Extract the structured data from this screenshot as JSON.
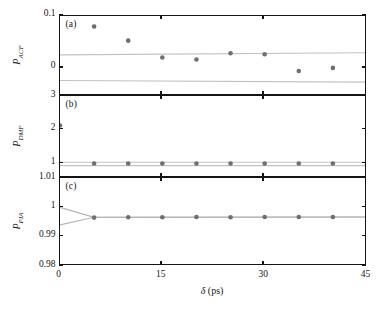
{
  "figure": {
    "x_axis": {
      "label_symbol": "δ",
      "label_unit": "(ps)",
      "ticks": [
        "0",
        "15",
        "30",
        "45"
      ],
      "min": 0,
      "max": 45
    },
    "panels": [
      {
        "tag": "(a)",
        "ylabel_base": "P",
        "ylabel_sub": "ACF",
        "yticks": [
          "0.1",
          "0"
        ],
        "ytick_values": [
          0.1,
          0
        ],
        "ymin": -0.0535,
        "ymax": 0.1
      },
      {
        "tag": "(b)",
        "ylabel_base": "P",
        "ylabel_sub": "DMF",
        "yticks": [
          "3",
          "2",
          "1"
        ],
        "ytick_values": [
          3,
          2,
          1
        ],
        "ymin": 0.56,
        "ymax": 3
      },
      {
        "tag": "(c)",
        "ylabel_base": "P",
        "ylabel_sub": "PIA",
        "yticks": [
          "1.01",
          "1",
          "0.99",
          "0.98"
        ],
        "ytick_values": [
          1.01,
          1,
          0.99,
          0.98
        ],
        "ymin": 0.98,
        "ymax": 1.01
      }
    ]
  },
  "chart_data": [
    {
      "type": "scatter",
      "panel": "(a)",
      "title": "",
      "xlabel": "δ (ps)",
      "ylabel": "P_ACF",
      "xlim": [
        0,
        45
      ],
      "ylim": [
        -0.0535,
        0.1
      ],
      "grid": false,
      "legend": "none",
      "xticks": [
        0,
        15,
        30,
        45
      ],
      "yticks": [
        0,
        0.1
      ],
      "series": [
        {
          "name": "P_ACF data",
          "marker": "filled-circle",
          "color": "#6f6f6f",
          "x": [
            5,
            10,
            15,
            20,
            25,
            30,
            35,
            40
          ],
          "y": [
            0.08,
            0.053,
            0.021,
            0.017,
            0.029,
            0.027,
            -0.005,
            0.001
          ]
        },
        {
          "name": "upper guide band",
          "type": "line",
          "color": "#c2c2c2",
          "x": [
            0,
            45
          ],
          "y": [
            0.026,
            0.03
          ]
        },
        {
          "name": "lower guide band",
          "type": "line",
          "color": "#c2c2c2",
          "x": [
            0,
            45
          ],
          "y": [
            -0.023,
            -0.026
          ]
        }
      ]
    },
    {
      "type": "scatter",
      "panel": "(b)",
      "title": "",
      "xlabel": "δ (ps)",
      "ylabel": "P_DMF",
      "xlim": [
        0,
        45
      ],
      "ylim": [
        0.56,
        3
      ],
      "grid": false,
      "legend": "none",
      "xticks": [
        0,
        15,
        30,
        45
      ],
      "yticks": [
        1,
        2,
        3
      ],
      "series": [
        {
          "name": "P_DMF data",
          "marker": "filled-circle",
          "color": "#6f6f6f",
          "x": [
            0,
            5,
            10,
            15,
            20,
            25,
            30,
            35,
            40,
            45
          ],
          "y": [
            2.12,
            0.99,
            0.99,
            0.99,
            0.99,
            0.99,
            0.99,
            0.99,
            0.99,
            0.99
          ]
        },
        {
          "name": "upper guide band",
          "type": "line",
          "color": "#c2c2c2",
          "x": [
            0,
            45
          ],
          "y": [
            1.03,
            1.03
          ]
        },
        {
          "name": "lower guide band",
          "type": "line",
          "color": "#c2c2c2",
          "x": [
            0,
            45
          ],
          "y": [
            0.93,
            0.93
          ]
        }
      ]
    },
    {
      "type": "scatter",
      "panel": "(c)",
      "title": "",
      "xlabel": "δ (ps)",
      "ylabel": "P_PIA",
      "xlim": [
        0,
        45
      ],
      "ylim": [
        0.98,
        1.01
      ],
      "grid": false,
      "legend": "none",
      "xticks": [
        0,
        15,
        30,
        45
      ],
      "yticks": [
        0.98,
        0.99,
        1,
        1.01
      ],
      "series": [
        {
          "name": "P_PIA data",
          "marker": "filled-circle",
          "color": "#6f6f6f",
          "x": [
            5,
            10,
            15,
            20,
            25,
            30,
            35,
            40
          ],
          "y": [
            0.9965,
            0.9966,
            0.9966,
            0.9967,
            0.9966,
            0.9967,
            0.9967,
            0.9967
          ]
        },
        {
          "name": "upper envelope",
          "type": "line",
          "color": "#b5b5b5",
          "x": [
            0,
            5,
            45
          ],
          "y": [
            1.0,
            0.9966,
            0.9967
          ]
        },
        {
          "name": "lower envelope",
          "type": "line",
          "color": "#b5b5b5",
          "x": [
            0,
            5,
            45
          ],
          "y": [
            0.994,
            0.9966,
            0.9967
          ]
        }
      ]
    }
  ]
}
